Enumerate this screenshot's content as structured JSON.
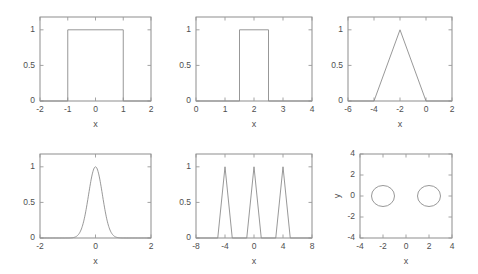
{
  "figure": {
    "background": "#ffffff",
    "line_color": "#8c8c8c",
    "axis_color": "#828282",
    "text_color": "#4f4f4f",
    "rows": 2,
    "cols": 3
  },
  "chart_data": [
    {
      "id": "panel-1",
      "type": "line",
      "title": "",
      "xlabel": "x",
      "ylabel": "",
      "xlim": [
        -2,
        2
      ],
      "ylim": [
        0,
        1.18
      ],
      "xticks": [
        -2,
        -1,
        0,
        1,
        2
      ],
      "xticklabels": [
        "-2",
        "-1",
        "0",
        "1",
        "2"
      ],
      "yticks": [
        0,
        0.5,
        1
      ],
      "yticklabels": [
        "0",
        "0.5",
        "1"
      ],
      "grid": false,
      "legend": null,
      "description": "rectangular pulse width 2 centered at 0",
      "x": [
        -2,
        -1,
        -1,
        1,
        1,
        2
      ],
      "y": [
        0,
        0,
        1,
        1,
        0,
        0
      ]
    },
    {
      "id": "panel-2",
      "type": "line",
      "title": "",
      "xlabel": "x",
      "ylabel": "",
      "xlim": [
        0,
        4
      ],
      "ylim": [
        0,
        1.18
      ],
      "xticks": [
        0,
        1,
        2,
        3,
        4
      ],
      "xticklabels": [
        "0",
        "1",
        "2",
        "3",
        "4"
      ],
      "yticks": [
        0,
        0.5,
        1
      ],
      "yticklabels": [
        "0",
        "0.5",
        "1"
      ],
      "grid": false,
      "legend": null,
      "description": "rectangular pulse width 1 centered at 2",
      "x": [
        0,
        1.5,
        1.5,
        2.5,
        2.5,
        4
      ],
      "y": [
        0,
        0,
        1,
        1,
        0,
        0
      ]
    },
    {
      "id": "panel-3",
      "type": "line",
      "title": "",
      "xlabel": "x",
      "ylabel": "",
      "xlim": [
        -6,
        2
      ],
      "ylim": [
        0,
        1.18
      ],
      "xticks": [
        -6,
        -4,
        -2,
        0,
        2
      ],
      "xticklabels": [
        "-6",
        "-4",
        "-2",
        "0",
        "2"
      ],
      "yticks": [
        0,
        0.5,
        1
      ],
      "yticklabels": [
        "0",
        "0.5",
        "1"
      ],
      "grid": false,
      "legend": null,
      "description": "triangular pulse peak 1 at x=-2 base from -4 to 0",
      "x": [
        -6,
        -4,
        -2,
        0,
        2
      ],
      "y": [
        0,
        0,
        1,
        0,
        0
      ]
    },
    {
      "id": "panel-4",
      "type": "line",
      "title": "",
      "xlabel": "x",
      "ylabel": "",
      "xlim": [
        -2,
        2
      ],
      "ylim": [
        0,
        1.18
      ],
      "xticks": [
        -2,
        0,
        2
      ],
      "xticklabels": [
        "-2",
        "0",
        "2"
      ],
      "yticks": [
        0,
        0.5,
        1
      ],
      "yticklabels": [
        "0",
        "0.5",
        "1"
      ],
      "grid": false,
      "legend": null,
      "description": "gaussian peak 1 centered at 0 sigma 0.25",
      "gaussian": {
        "amplitude": 1,
        "mean": 0,
        "sigma": 0.25
      }
    },
    {
      "id": "panel-5",
      "type": "line",
      "title": "",
      "xlabel": "x",
      "ylabel": "",
      "xlim": [
        -8,
        8
      ],
      "ylim": [
        0,
        1.18
      ],
      "xticks": [
        -8,
        -4,
        0,
        4,
        8
      ],
      "xticklabels": [
        "-8",
        "-4",
        "0",
        "4",
        "8"
      ],
      "yticks": [
        0,
        0.5,
        1
      ],
      "yticklabels": [
        "0",
        "0.5",
        "1"
      ],
      "grid": false,
      "legend": null,
      "description": "three triangular pulses peak 1 at x=-4, 0, 4 each half width 1",
      "x": [
        -8,
        -5,
        -4,
        -3,
        -1,
        0,
        1,
        3,
        4,
        5,
        8
      ],
      "y": [
        0,
        0,
        1,
        0,
        0,
        1,
        0,
        0,
        1,
        0,
        0
      ]
    },
    {
      "id": "panel-6",
      "type": "line",
      "title": "",
      "xlabel": "x",
      "ylabel": "y",
      "xlim": [
        -4,
        4
      ],
      "ylim": [
        -4,
        4
      ],
      "xticks": [
        -4,
        -2,
        0,
        2,
        4
      ],
      "xticklabels": [
        "-4",
        "-2",
        "0",
        "2",
        "4"
      ],
      "yticks": [
        -4,
        -2,
        0,
        2,
        4
      ],
      "yticklabels": [
        "-4",
        "-2",
        "0",
        "2",
        "4"
      ],
      "grid": false,
      "legend": null,
      "description": "two circles radius 1 centered at (-2,0) and (2,0)",
      "circles": [
        {
          "cx": -2,
          "cy": 0,
          "r": 1
        },
        {
          "cx": 2,
          "cy": 0,
          "r": 1
        }
      ]
    }
  ],
  "panels": [
    {
      "left": 40,
      "top": 17,
      "width": 111,
      "height": 84,
      "xlabel_dy": 26,
      "ylabel_dx": 0
    },
    {
      "left": 196,
      "top": 17,
      "width": 116,
      "height": 84,
      "xlabel_dy": 26,
      "ylabel_dx": 0
    },
    {
      "left": 348,
      "top": 17,
      "width": 104,
      "height": 84,
      "xlabel_dy": 26,
      "ylabel_dx": 0
    },
    {
      "left": 40,
      "top": 154,
      "width": 111,
      "height": 84,
      "xlabel_dy": 26,
      "ylabel_dx": 0
    },
    {
      "left": 196,
      "top": 154,
      "width": 116,
      "height": 84,
      "xlabel_dy": 26,
      "ylabel_dx": 0
    },
    {
      "left": 360,
      "top": 154,
      "width": 92,
      "height": 84,
      "xlabel_dy": 26,
      "ylabel_dx": 0
    }
  ]
}
